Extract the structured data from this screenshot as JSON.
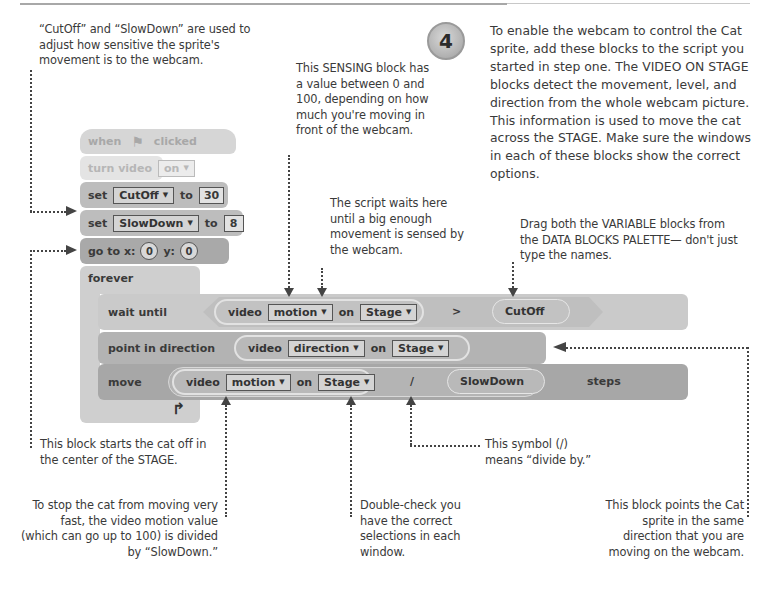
{
  "step": {
    "number": "4",
    "text": "To enable the webcam to control the Cat sprite, add these blocks to the script you started in step one. The VIDEO ON STAGE blocks detect the movement, level, and direction from the whole webcam picture. This information is used to move the cat across the STAGE. Make sure the windows in each of these blocks show the correct options."
  },
  "notes": {
    "variables": "“CutOff” and “SlowDown” are used to adjust how sensitive the sprite's movement is to the webcam.",
    "sensing": "This SENSING block has a value between 0 and 100, depending on how much you're moving in front of the webcam.",
    "waits": "The script waits here until a big enough movement is sensed by the webcam.",
    "drag": "Drag both the VARIABLE blocks from the DATA BLOCKS PALETTE— don't just type the names.",
    "center": "This block starts the cat off in the center of the STAGE.",
    "divide": "This symbol (/) means “divide by.”",
    "slowdown": "To stop the cat from moving very fast, the video motion value (which can go up to 100) is divided by “SlowDown.”",
    "doublecheck": "Double-check you have the correct selections in each window.",
    "direction": "This block points the Cat sprite in the same direction that you are moving on the webcam."
  },
  "script": {
    "when_label": "when",
    "clicked_label": "clicked",
    "turn_video_label": "turn video",
    "turn_video_value": "on",
    "set_label": "set",
    "to_label": "to",
    "set1_var": "CutOff",
    "set1_value": "30",
    "set2_var": "SlowDown",
    "set2_value": "8",
    "goto_label": "go to x:",
    "goto_x": "0",
    "goto_y_label": "y:",
    "goto_y": "0",
    "forever_label": "forever",
    "wait_until_label": "wait until",
    "video_label": "video",
    "on_label": "on",
    "motion_option": "motion",
    "stage_option": "Stage",
    "gt_symbol": ">",
    "cutoff_var": "CutOff",
    "point_label": "point in direction",
    "direction_option": "direction",
    "move_label": "move",
    "divide_symbol": "/",
    "slowdown_var": "SlowDown",
    "steps_label": "steps",
    "loop_arrow": "↱"
  }
}
